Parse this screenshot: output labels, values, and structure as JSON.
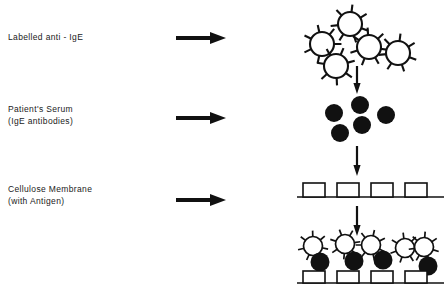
{
  "figure": {
    "width": 448,
    "height": 287,
    "background": "#ffffff",
    "ink": "#111111",
    "type": "biology-assay-schematic"
  },
  "labels": [
    {
      "name": "labelled-anti-ige",
      "lines": [
        "Labelled anti - IgE"
      ],
      "x": 8,
      "y": 31
    },
    {
      "name": "patients-serum",
      "lines": [
        "Patient's Serum",
        "(IgE antibodies)"
      ],
      "x": 8,
      "y": 103
    },
    {
      "name": "cellulose-membrane",
      "lines": [
        "Cellulose Membrane",
        "(with Antigen)"
      ],
      "x": 8,
      "y": 183
    }
  ],
  "horizontal_arrows": [
    {
      "name": "arrow-to-labelled-anti-ige",
      "x": 176,
      "y": 30,
      "length": 50
    },
    {
      "name": "arrow-to-patients-serum",
      "x": 176,
      "y": 110,
      "length": 50
    },
    {
      "name": "arrow-to-cellulose-membrane",
      "x": 176,
      "y": 192,
      "length": 50
    }
  ],
  "vertical_arrows": [
    {
      "name": "arrow-down-stage-1-to-2",
      "x": 357,
      "y": 66,
      "length": 28
    },
    {
      "name": "arrow-down-stage-2-to-3",
      "x": 357,
      "y": 146,
      "length": 30
    },
    {
      "name": "arrow-down-stage-3-to-4",
      "x": 357,
      "y": 206,
      "length": 30
    }
  ],
  "stage_labelled_antibodies": {
    "name": "labelled-antibody-cluster",
    "shape": "spiked-open-circle",
    "fill": "#ffffff",
    "stroke": "#111111",
    "count": 5,
    "radius": 12,
    "spikes": 7,
    "items": [
      {
        "cx": 350,
        "cy": 24
      },
      {
        "cx": 322,
        "cy": 44
      },
      {
        "cx": 369,
        "cy": 47
      },
      {
        "cx": 336,
        "cy": 66
      },
      {
        "cx": 398,
        "cy": 53
      }
    ]
  },
  "stage_serum_antibodies": {
    "name": "serum-antibody-cluster",
    "shape": "filled-circle",
    "fill": "#111111",
    "count": 5,
    "radius": 9,
    "items": [
      {
        "cx": 334,
        "cy": 113
      },
      {
        "cx": 360,
        "cy": 105
      },
      {
        "cx": 362,
        "cy": 125
      },
      {
        "cx": 340,
        "cy": 133
      },
      {
        "cx": 386,
        "cy": 115
      }
    ]
  },
  "stage_membrane": {
    "name": "cellulose-membrane-strip",
    "line_y": 197,
    "line_x1": 297,
    "line_x2": 444,
    "antigen_shape": "open-square",
    "antigen_fill": "#ffffff",
    "antigen_stroke": "#111111",
    "antigen_count": 4,
    "antigen_width": 22,
    "antigen_height": 14,
    "antigen_x": [
      303,
      337,
      371,
      405
    ]
  },
  "stage_bound_complex": {
    "name": "bound-complex-strip",
    "line_y": 283,
    "line_x1": 297,
    "line_x2": 444,
    "antigen_count": 4,
    "antigen_width": 22,
    "antigen_height": 12,
    "antigen_x": [
      303,
      337,
      371,
      405
    ],
    "serum_antibodies": [
      {
        "cx": 320,
        "cy": 262
      },
      {
        "cx": 354,
        "cy": 261
      },
      {
        "cx": 383,
        "cy": 260
      },
      {
        "cx": 428,
        "cy": 266
      }
    ],
    "labelled_antibodies": [
      {
        "cx": 313,
        "cy": 246
      },
      {
        "cx": 345,
        "cy": 244
      },
      {
        "cx": 371,
        "cy": 245
      },
      {
        "cx": 405,
        "cy": 248
      },
      {
        "cx": 424,
        "cy": 247
      }
    ]
  }
}
